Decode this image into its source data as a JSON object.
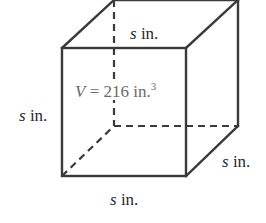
{
  "diagram": {
    "type": "cube",
    "labels": {
      "top_edge": {
        "variable": "s",
        "unit": "in."
      },
      "left_edge": {
        "variable": "s",
        "unit": "in."
      },
      "right_edge": {
        "variable": "s",
        "unit": "in."
      },
      "bottom_edge": {
        "variable": "s",
        "unit": "in."
      }
    },
    "volume": {
      "variable": "V",
      "equals": "=",
      "value": "216",
      "unit": "in.",
      "exponent": "3"
    },
    "colors": {
      "edge": "#3a3a3a",
      "label": "#2a2a2a",
      "volume_text": "#6a6a6a"
    }
  }
}
